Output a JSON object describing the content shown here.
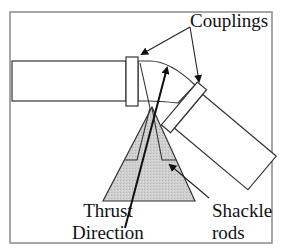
{
  "diagram": {
    "labels": {
      "couplings": "Couplings",
      "thrust_line1": "Thrust",
      "thrust_line2": "Direction",
      "shackle_line1": "Shackle",
      "shackle_line2": "rods"
    },
    "components": [
      "left-pipe",
      "left-coupling",
      "elbow-bend",
      "right-coupling",
      "right-pipe",
      "thrust-block-triangle",
      "shackle-rods",
      "thrust-direction-arrow"
    ],
    "colors": {
      "frame": "#8a8a8a",
      "stroke": "#222222",
      "thrust_block_fill": "#c8c8c8",
      "background": "#ffffff"
    }
  }
}
